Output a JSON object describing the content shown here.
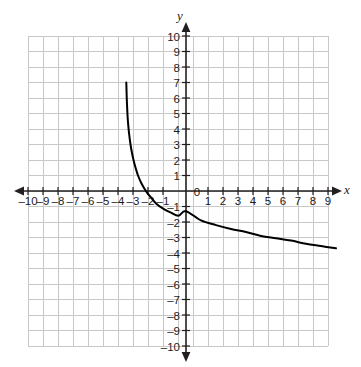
{
  "figure": {
    "kind": "coordinate-plane-graph",
    "background_color": "#ffffff",
    "grid_color": "#c8c8c8",
    "axis_color": "#231f20",
    "curve_color": "#000000"
  },
  "axes": {
    "x_axis_label": "x",
    "y_axis_label": "y",
    "x_tick_labels": [
      "–10",
      "–9",
      "–8",
      "–7",
      "–6",
      "–5",
      "–4",
      "–3",
      "–2",
      "–1",
      "1",
      "2",
      "3",
      "4",
      "5",
      "6",
      "7",
      "8",
      "9",
      "10"
    ],
    "y_tick_labels": [
      "10",
      "9",
      "8",
      "7",
      "6",
      "5",
      "4",
      "3",
      "2",
      "1",
      "–1",
      "–2",
      "–3",
      "–4",
      "–5",
      "–6",
      "–7",
      "–8",
      "–9",
      "–10"
    ],
    "origin_label": "0",
    "x_min": -10,
    "x_max": 10,
    "y_min": -10,
    "y_max": 10,
    "grid_step": 1,
    "arrow_ends": [
      "left",
      "right",
      "up",
      "down"
    ]
  },
  "chart_data": {
    "type": "line",
    "title": "",
    "xlabel": "x",
    "ylabel": "y",
    "xlim": [
      -10,
      10
    ],
    "ylim": [
      -10,
      10
    ],
    "grid": true,
    "legend": "none",
    "series": [
      {
        "name": "logarithmic curve",
        "description": "Decreasing logarithmic curve with a vertical asymptote near x = -4; falls steeply from y = 7 then flattens toward the right.",
        "x": [
          -3.98,
          -3.95,
          -3.9,
          -3.85,
          -3.8,
          -3.7,
          -3.6,
          -3.5,
          -3.4,
          -3.3,
          -3.2,
          -3.0,
          -2.8,
          -2.6,
          -2.35,
          -2.0,
          -1.5,
          -1.0,
          -0.5,
          0.0,
          1.0,
          2.0,
          3.0,
          4.0,
          5.0,
          6.0,
          7.0,
          8.0,
          9.0,
          10.0
        ],
        "y": [
          7.0,
          6.0,
          4.9,
          4.25,
          3.75,
          3.0,
          2.45,
          2.0,
          1.63,
          1.3,
          1.0,
          0.55,
          0.2,
          -0.1,
          -0.4,
          -0.8,
          -1.15,
          -1.4,
          -1.6,
          -1.3,
          -1.9,
          -2.2,
          -2.45,
          -2.65,
          -2.9,
          -3.05,
          -3.2,
          -3.4,
          -3.55,
          -3.7
        ]
      }
    ]
  }
}
